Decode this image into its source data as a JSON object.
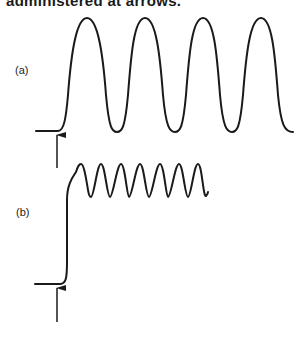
{
  "caption": "administered at arrows.",
  "panels": [
    {
      "label": "(a)",
      "description": "slow large-amplitude oscillation after stimulus",
      "cycles": 4
    },
    {
      "label": "(b)",
      "description": "rapid rise followed by fast small-amplitude oscillation",
      "cycles": 7
    }
  ],
  "colors": {
    "line": "#1a1a1a",
    "background": "#ffffff"
  }
}
